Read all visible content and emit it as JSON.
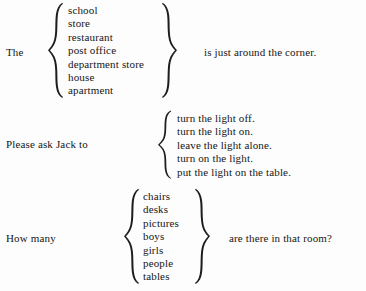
{
  "page": {
    "background_color": "#fdfdfd",
    "text_color": "#151515"
  },
  "frames": [
    {
      "id": "frame-1",
      "lead_in": "The",
      "tail": "is just around the corner.",
      "left_brace": "left-curly-brace",
      "right_brace": "right-curly-brace",
      "options": [
        "school",
        "store",
        "restaurant",
        "post office",
        "department store",
        "house",
        "apartment"
      ]
    },
    {
      "id": "frame-2",
      "lead_in": "Please ask Jack to",
      "tail": "",
      "left_brace": "left-curly-brace",
      "right_brace": "",
      "options": [
        "turn the light off.",
        "turn the light on.",
        "leave the light alone.",
        "turn on the light.",
        "put the light on the table."
      ]
    },
    {
      "id": "frame-3",
      "lead_in": "How many",
      "tail": "are there in that room?",
      "left_brace": "left-curly-brace",
      "right_brace": "right-curly-brace",
      "options": [
        "chairs",
        "desks",
        "pictures",
        "boys",
        "girls",
        "people",
        "tables"
      ]
    }
  ]
}
